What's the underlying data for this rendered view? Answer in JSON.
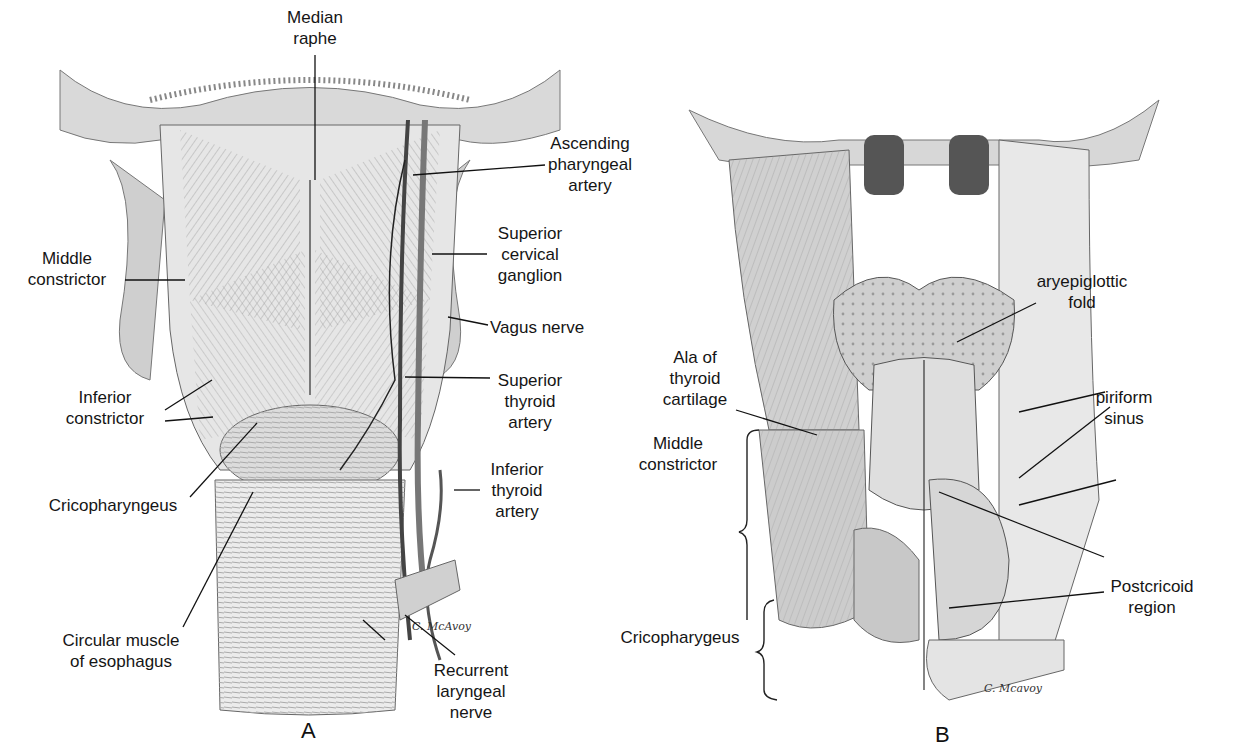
{
  "figure": {
    "panels": [
      {
        "id": "A",
        "letter": "A",
        "labels": {
          "median_raphe": "Median\nraphe",
          "ascending_pharyngeal_artery": "Ascending\npharyngeal\nartery",
          "middle_constrictor": "Middle\nconstrictor",
          "superior_cervical_ganglion": "Superior\ncervical\nganglion",
          "vagus_nerve": "Vagus nerve",
          "inferior_constrictor": "Inferior\nconstrictor",
          "superior_thyroid_artery": "Superior\nthyroid\nartery",
          "cricopharyngeus": "Cricopharyngeus",
          "inferior_thyroid_artery": "Inferior\nthyroid\nartery",
          "circular_muscle_of_esophagus": "Circular muscle\nof esophagus",
          "recurrent_laryngeal_nerve": "Recurrent\nlaryngeal\nnerve"
        },
        "signature": "C. McAvoy"
      },
      {
        "id": "B",
        "letter": "B",
        "labels": {
          "aryepiglottic_fold": "aryepiglottic\nfold",
          "ala_of_thyroid_cartilage": "Ala of\nthyroid\ncartilage",
          "piriform_sinus": "piriform\nsinus",
          "middle_constrictor": "Middle\nconstrictor",
          "postcricoid_region": "Postcricoid\nregion",
          "cricopharygeus": "Cricopharygeus"
        },
        "signature": "C. Mcavoy"
      }
    ]
  }
}
